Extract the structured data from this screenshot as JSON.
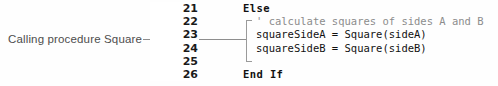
{
  "annotation": {
    "label": "Calling procedure Square",
    "leader_color": "#8e8e8e",
    "text_color": "#4d4d4d"
  },
  "gutter": {
    "line_numbers": [
      "21",
      "22",
      "23",
      "24",
      "25",
      "26"
    ]
  },
  "code": {
    "language": "Visual Basic",
    "keyword_color": "#111111",
    "comment_color": "#8c8c8c",
    "lines": [
      {
        "text": "Else",
        "style": "kw",
        "indent": false
      },
      {
        "text": "' calculate squares of sides A and B",
        "style": "comment",
        "indent": true
      },
      {
        "text": "squareSideA = Square(sideA)",
        "style": "plain",
        "indent": true
      },
      {
        "text": "squareSideB = Square(sideB)",
        "style": "plain",
        "indent": true
      },
      {
        "text": "",
        "style": "plain",
        "indent": false
      },
      {
        "text": "End If",
        "style": "kw",
        "indent": false
      }
    ]
  },
  "bracket": {
    "name": "block-bracket",
    "color": "#9a9a9a"
  }
}
